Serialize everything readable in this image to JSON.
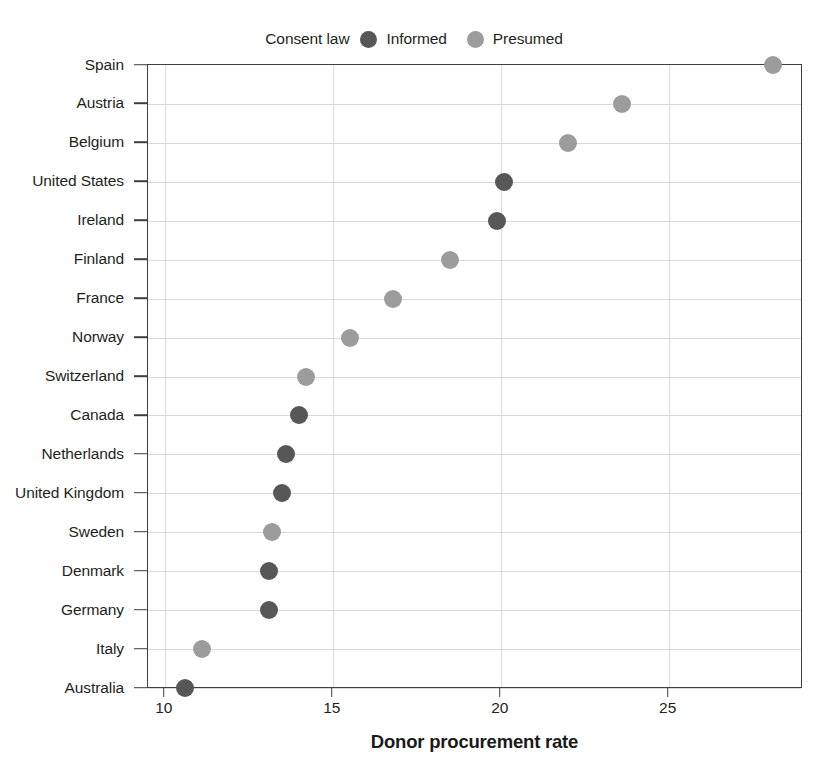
{
  "chart_data": {
    "type": "scatter",
    "title": "",
    "xlabel": "Donor procurement rate",
    "ylabel": "",
    "xlim": [
      9.5,
      29.0
    ],
    "xticks": [
      10,
      15,
      20,
      25
    ],
    "xtick_labels": [
      "10",
      "15",
      "20",
      "25"
    ],
    "grid": true,
    "orientation": "horizontal-dot-plot",
    "legend": {
      "title": "Consent law",
      "position": "top-center",
      "entries": [
        {
          "name": "Informed",
          "color": "#575757"
        },
        {
          "name": "Presumed",
          "color": "#9c9c9c"
        }
      ]
    },
    "categories": [
      "Spain",
      "Austria",
      "Belgium",
      "United States",
      "Ireland",
      "Finland",
      "France",
      "Norway",
      "Switzerland",
      "Canada",
      "Netherlands",
      "United Kingdom",
      "Sweden",
      "Denmark",
      "Germany",
      "Italy",
      "Australia"
    ],
    "points": [
      {
        "label": "Spain",
        "value": 28.1,
        "group": "Presumed"
      },
      {
        "label": "Austria",
        "value": 23.6,
        "group": "Presumed"
      },
      {
        "label": "Belgium",
        "value": 22.0,
        "group": "Presumed"
      },
      {
        "label": "United States",
        "value": 20.1,
        "group": "Informed"
      },
      {
        "label": "Ireland",
        "value": 19.9,
        "group": "Informed"
      },
      {
        "label": "Finland",
        "value": 18.5,
        "group": "Presumed"
      },
      {
        "label": "France",
        "value": 16.8,
        "group": "Presumed"
      },
      {
        "label": "Norway",
        "value": 15.5,
        "group": "Presumed"
      },
      {
        "label": "Switzerland",
        "value": 14.2,
        "group": "Presumed"
      },
      {
        "label": "Canada",
        "value": 14.0,
        "group": "Informed"
      },
      {
        "label": "Netherlands",
        "value": 13.6,
        "group": "Informed"
      },
      {
        "label": "United Kingdom",
        "value": 13.5,
        "group": "Informed"
      },
      {
        "label": "Sweden",
        "value": 13.2,
        "group": "Presumed"
      },
      {
        "label": "Denmark",
        "value": 13.1,
        "group": "Informed"
      },
      {
        "label": "Germany",
        "value": 13.1,
        "group": "Informed"
      },
      {
        "label": "Italy",
        "value": 11.1,
        "group": "Presumed"
      },
      {
        "label": "Australia",
        "value": 10.6,
        "group": "Informed"
      }
    ]
  }
}
